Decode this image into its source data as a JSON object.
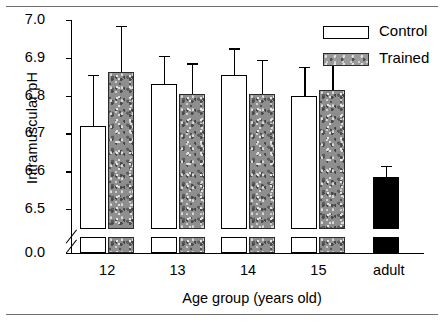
{
  "figure": {
    "rules": {
      "top": "horizontal-rule",
      "bottom": "horizontal-rule"
    }
  },
  "legend": {
    "position": "top-right",
    "entries": [
      {
        "label": "Control",
        "swatch": "white-open-bar"
      },
      {
        "label": "Trained",
        "swatch": "gray-textured-bar"
      }
    ]
  },
  "chart_data": {
    "type": "bar",
    "title": "",
    "subtitle": "",
    "xlabel": "Age group (years old)",
    "ylabel": "Intramuscular pH",
    "categories": [
      "12",
      "13",
      "14",
      "15",
      "adult"
    ],
    "ytick_labels": [
      "7.0",
      "6.9",
      "6.8",
      "6.7",
      "6.6",
      "6.5",
      "0.0"
    ],
    "ytick_values": [
      7.0,
      6.9,
      6.8,
      6.7,
      6.6,
      6.5,
      0.0
    ],
    "ylim": [
      6.43,
      7.0
    ],
    "axis_break": true,
    "axis_break_note": "y-axis broken between 6.5 and 0.0",
    "grid": false,
    "legend_position": "top-right",
    "error_bar_type": "upper-sd",
    "series": [
      {
        "name": "Control",
        "values": [
          6.72,
          6.83,
          6.855,
          6.8,
          null
        ],
        "errors_upper": [
          6.855,
          6.905,
          6.925,
          6.875,
          null
        ]
      },
      {
        "name": "Trained",
        "values": [
          6.862,
          6.803,
          6.803,
          6.815,
          null
        ],
        "errors_upper": [
          6.985,
          6.885,
          6.895,
          6.895,
          null
        ]
      },
      {
        "name": "Adult",
        "values": [
          null,
          null,
          null,
          null,
          6.585
        ],
        "errors_upper": [
          null,
          null,
          null,
          null,
          6.615
        ]
      }
    ]
  }
}
